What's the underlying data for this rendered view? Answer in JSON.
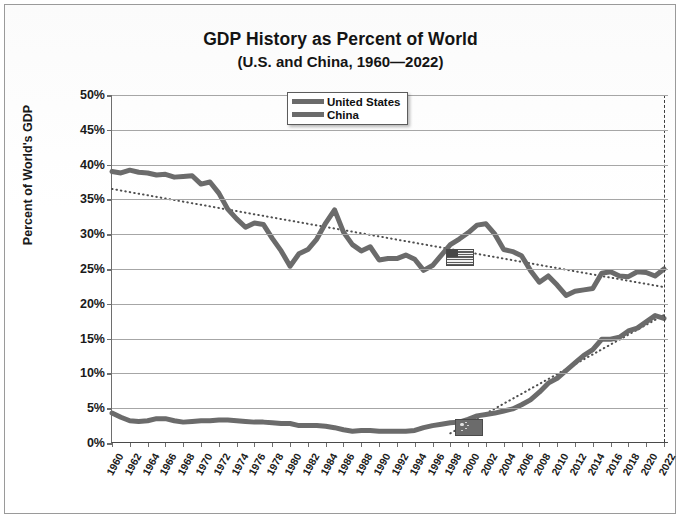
{
  "chart_data": {
    "type": "line",
    "title": "GDP History as Percent of World",
    "subtitle": "(U.S. and China, 1960—2022)",
    "xlabel": "",
    "ylabel": "Percent of World's GDP",
    "ylim": [
      0,
      50
    ],
    "xlim": [
      1960,
      2022
    ],
    "ytick_labels": [
      "0%",
      "5%",
      "10%",
      "15%",
      "20%",
      "25%",
      "30%",
      "35%",
      "40%",
      "45%",
      "50%"
    ],
    "ytick_values": [
      0,
      5,
      10,
      15,
      20,
      25,
      30,
      35,
      40,
      45,
      50
    ],
    "xtick_labels": [
      "1960",
      "1962",
      "1964",
      "1966",
      "1968",
      "1970",
      "1972",
      "1974",
      "1976",
      "1978",
      "1980",
      "1982",
      "1984",
      "1986",
      "1988",
      "1990",
      "1992",
      "1994",
      "1996",
      "1998",
      "2000",
      "2002",
      "2004",
      "2006",
      "2008",
      "2010",
      "2012",
      "2014",
      "2016",
      "2018",
      "2020",
      "2022"
    ],
    "grid": "horizontal",
    "legend_position": "top-center",
    "legend": [
      "United States",
      "China"
    ],
    "x": [
      1960,
      1961,
      1962,
      1963,
      1964,
      1965,
      1966,
      1967,
      1968,
      1969,
      1970,
      1971,
      1972,
      1973,
      1974,
      1975,
      1976,
      1977,
      1978,
      1979,
      1980,
      1981,
      1982,
      1983,
      1984,
      1985,
      1986,
      1987,
      1988,
      1989,
      1990,
      1991,
      1992,
      1993,
      1994,
      1995,
      1996,
      1997,
      1998,
      1999,
      2000,
      2001,
      2002,
      2003,
      2004,
      2005,
      2006,
      2007,
      2008,
      2009,
      2010,
      2011,
      2012,
      2013,
      2014,
      2015,
      2016,
      2017,
      2018,
      2019,
      2020,
      2021,
      2022
    ],
    "series": [
      {
        "name": "United States",
        "color": "#6b6b6b",
        "values": [
          39.0,
          38.8,
          39.2,
          38.9,
          38.8,
          38.5,
          38.6,
          38.2,
          38.3,
          38.4,
          37.2,
          37.5,
          35.9,
          33.6,
          32.2,
          31.0,
          31.6,
          31.4,
          29.4,
          27.6,
          25.4,
          27.2,
          27.8,
          29.3,
          31.6,
          33.5,
          30.3,
          28.5,
          27.6,
          28.2,
          26.3,
          26.5,
          26.5,
          27.0,
          26.4,
          24.8,
          25.5,
          27.0,
          28.5,
          29.3,
          30.2,
          31.3,
          31.5,
          30.0,
          27.8,
          27.5,
          26.9,
          24.8,
          23.1,
          24.0,
          22.7,
          21.2,
          21.8,
          22.0,
          22.2,
          24.4,
          24.6,
          24.0,
          23.9,
          24.6,
          24.5,
          24.0,
          25.0
        ]
      },
      {
        "name": "China",
        "color": "#6b6b6b",
        "values": [
          4.3,
          3.7,
          3.2,
          3.1,
          3.2,
          3.5,
          3.5,
          3.2,
          3.0,
          3.1,
          3.2,
          3.2,
          3.3,
          3.3,
          3.2,
          3.1,
          3.0,
          3.0,
          2.9,
          2.8,
          2.8,
          2.5,
          2.5,
          2.5,
          2.4,
          2.2,
          1.9,
          1.7,
          1.8,
          1.8,
          1.7,
          1.7,
          1.7,
          1.7,
          1.8,
          2.2,
          2.5,
          2.7,
          2.9,
          3.0,
          3.4,
          3.9,
          4.1,
          4.3,
          4.6,
          4.9,
          5.5,
          6.2,
          7.3,
          8.6,
          9.3,
          10.4,
          11.5,
          12.6,
          13.4,
          14.9,
          14.9,
          15.2,
          16.1,
          16.5,
          17.4,
          18.3,
          17.9
        ]
      }
    ],
    "trendlines": [
      {
        "for": "United States",
        "style": "dotted",
        "start": {
          "x": 1960,
          "y": 36.5
        },
        "end": {
          "x": 2022,
          "y": 22.4
        }
      },
      {
        "for": "China",
        "style": "dotted",
        "start": {
          "x": 1998,
          "y": 1.4
        },
        "end": {
          "x": 2022,
          "y": 18.4
        }
      }
    ],
    "markers": [
      {
        "name": "us-flag-marker",
        "series": "United States",
        "x": 1999,
        "y": 26.9,
        "label": "United States flag"
      },
      {
        "name": "china-flag-marker",
        "series": "China",
        "x": 2000,
        "y": 2.5,
        "label": "China flag"
      }
    ],
    "annotations": [
      {
        "name": "year-2022-marker",
        "type": "vertical-dashed-line",
        "x": 2022
      }
    ]
  }
}
